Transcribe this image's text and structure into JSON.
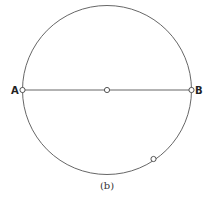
{
  "diagram": {
    "caption": "(b)",
    "circle": {
      "cx": 107,
      "cy": 90,
      "r": 85
    },
    "points": {
      "A": {
        "label": "A",
        "x": 22,
        "y": 90
      },
      "B": {
        "label": "B",
        "x": 192,
        "y": 90
      },
      "center": {
        "x": 107,
        "y": 90
      },
      "P": {
        "x": 153,
        "y": 159
      }
    },
    "colors": {
      "stroke": "#555555",
      "text": "#222222"
    }
  }
}
